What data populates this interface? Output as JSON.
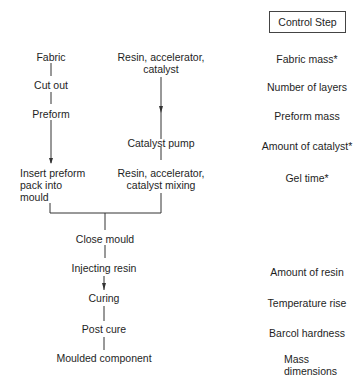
{
  "header": {
    "control_step_title": "Control Step"
  },
  "left_branch": {
    "fabric": "Fabric",
    "cut_out": "Cut out",
    "preform": "Preform",
    "insert": [
      "Insert preform",
      "pack into",
      "mould"
    ]
  },
  "right_branch": {
    "inputs": [
      "Resin, accelerator,",
      "catalyst"
    ],
    "catalyst_pump": "Catalyst pump",
    "mixing": [
      "Resin, accelerator,",
      "catalyst mixing"
    ]
  },
  "main_flow": {
    "close_mould": "Close mould",
    "injecting_resin": "Injecting resin",
    "curing": "Curing",
    "post_cure": "Post cure",
    "moulded_component": "Moulded component"
  },
  "control_steps": {
    "fabric_mass": "Fabric mass*",
    "number_of_layers": "Number of layers",
    "preform_mass": "Preform mass",
    "amount_of_catalyst": "Amount of catalyst*",
    "gel_time": "Gel time*",
    "amount_of_resin": "Amount of resin",
    "temperature_rise": "Temperature rise",
    "barcol_hardness": "Barcol hardness",
    "mass_dimensions": [
      "Mass",
      "dimensions"
    ]
  },
  "colors": {
    "line": "#333333",
    "text": "#1e1e1e",
    "background": "#ffffff"
  }
}
